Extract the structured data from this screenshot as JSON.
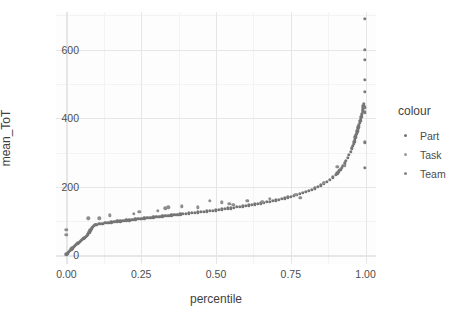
{
  "chart_data": {
    "type": "scatter",
    "title": "",
    "xlabel": "percentile",
    "ylabel": "mean_ToT",
    "xlim": [
      -0.035,
      1.035
    ],
    "ylim": [
      -25,
      710
    ],
    "xticks": [
      "0.00",
      "0.25",
      "0.50",
      "0.75",
      "1.00"
    ],
    "xtick_values": [
      0.0,
      0.25,
      0.5,
      0.75,
      1.0
    ],
    "yticks": [
      "0",
      "200",
      "400",
      "600"
    ],
    "ytick_values": [
      0,
      200,
      400,
      600
    ],
    "grid": "major and minor, light gray on white panel",
    "legend": {
      "title": "colour",
      "position": "right",
      "entries": [
        {
          "label": "Part",
          "color": "#757575"
        },
        {
          "label": "Task",
          "color": "#9a9a9a"
        },
        {
          "label": "Team",
          "color": "#848484"
        }
      ]
    },
    "series": [
      {
        "name": "Part",
        "color": "#757575",
        "comment": "dense monotone S-curve of per-participant mean ToT across percentiles",
        "points": [
          [
            0.0,
            3
          ],
          [
            0.004,
            6
          ],
          [
            0.008,
            10
          ],
          [
            0.012,
            14
          ],
          [
            0.016,
            18
          ],
          [
            0.02,
            21
          ],
          [
            0.024,
            25
          ],
          [
            0.028,
            28
          ],
          [
            0.032,
            31
          ],
          [
            0.036,
            34
          ],
          [
            0.04,
            37
          ],
          [
            0.044,
            40
          ],
          [
            0.048,
            43
          ],
          [
            0.052,
            46
          ],
          [
            0.056,
            49
          ],
          [
            0.06,
            52
          ],
          [
            0.064,
            55
          ],
          [
            0.068,
            58
          ],
          [
            0.072,
            62
          ],
          [
            0.076,
            67
          ],
          [
            0.08,
            73
          ],
          [
            0.084,
            79
          ],
          [
            0.088,
            84
          ],
          [
            0.092,
            87
          ],
          [
            0.096,
            89
          ],
          [
            0.1,
            90
          ],
          [
            0.11,
            92
          ],
          [
            0.12,
            93
          ],
          [
            0.13,
            95
          ],
          [
            0.14,
            96
          ],
          [
            0.15,
            97
          ],
          [
            0.16,
            98
          ],
          [
            0.17,
            99
          ],
          [
            0.18,
            100
          ],
          [
            0.19,
            101
          ],
          [
            0.2,
            102
          ],
          [
            0.21,
            103
          ],
          [
            0.22,
            104
          ],
          [
            0.23,
            105
          ],
          [
            0.24,
            106
          ],
          [
            0.25,
            107
          ],
          [
            0.26,
            108
          ],
          [
            0.27,
            109
          ],
          [
            0.28,
            110
          ],
          [
            0.29,
            111
          ],
          [
            0.3,
            112
          ],
          [
            0.31,
            113
          ],
          [
            0.32,
            114
          ],
          [
            0.33,
            115
          ],
          [
            0.34,
            116
          ],
          [
            0.35,
            117
          ],
          [
            0.36,
            118
          ],
          [
            0.37,
            119
          ],
          [
            0.38,
            120
          ],
          [
            0.39,
            121
          ],
          [
            0.4,
            122
          ],
          [
            0.41,
            123
          ],
          [
            0.42,
            124
          ],
          [
            0.43,
            125
          ],
          [
            0.44,
            126
          ],
          [
            0.45,
            127
          ],
          [
            0.46,
            128
          ],
          [
            0.47,
            129
          ],
          [
            0.48,
            130
          ],
          [
            0.49,
            131
          ],
          [
            0.5,
            132
          ],
          [
            0.51,
            133
          ],
          [
            0.52,
            134
          ],
          [
            0.53,
            136
          ],
          [
            0.54,
            137
          ],
          [
            0.55,
            138
          ],
          [
            0.56,
            139
          ],
          [
            0.57,
            141
          ],
          [
            0.58,
            142
          ],
          [
            0.59,
            143
          ],
          [
            0.6,
            145
          ],
          [
            0.61,
            146
          ],
          [
            0.62,
            148
          ],
          [
            0.63,
            149
          ],
          [
            0.64,
            151
          ],
          [
            0.65,
            152
          ],
          [
            0.66,
            154
          ],
          [
            0.67,
            156
          ],
          [
            0.68,
            157
          ],
          [
            0.69,
            159
          ],
          [
            0.7,
            161
          ],
          [
            0.71,
            163
          ],
          [
            0.72,
            165
          ],
          [
            0.73,
            167
          ],
          [
            0.74,
            169
          ],
          [
            0.75,
            171
          ],
          [
            0.76,
            174
          ],
          [
            0.77,
            176
          ],
          [
            0.78,
            179
          ],
          [
            0.79,
            182
          ],
          [
            0.8,
            185
          ],
          [
            0.81,
            188
          ],
          [
            0.82,
            192
          ],
          [
            0.83,
            196
          ],
          [
            0.84,
            200
          ],
          [
            0.85,
            205
          ],
          [
            0.86,
            210
          ],
          [
            0.87,
            215
          ],
          [
            0.88,
            221
          ],
          [
            0.89,
            228
          ],
          [
            0.9,
            236
          ],
          [
            0.905,
            240
          ],
          [
            0.91,
            245
          ],
          [
            0.915,
            250
          ],
          [
            0.92,
            256
          ],
          [
            0.925,
            262
          ],
          [
            0.93,
            269
          ],
          [
            0.935,
            276
          ],
          [
            0.94,
            284
          ],
          [
            0.945,
            293
          ],
          [
            0.95,
            303
          ],
          [
            0.955,
            313
          ],
          [
            0.958,
            320
          ],
          [
            0.96,
            326
          ],
          [
            0.962,
            332
          ],
          [
            0.964,
            338
          ],
          [
            0.966,
            344
          ],
          [
            0.968,
            350
          ],
          [
            0.97,
            356
          ],
          [
            0.972,
            362
          ],
          [
            0.974,
            368
          ],
          [
            0.976,
            374
          ],
          [
            0.978,
            380
          ],
          [
            0.98,
            386
          ],
          [
            0.982,
            392
          ],
          [
            0.984,
            398
          ],
          [
            0.986,
            405
          ],
          [
            0.988,
            412
          ],
          [
            0.99,
            420
          ],
          [
            0.991,
            425
          ],
          [
            0.992,
            430
          ],
          [
            0.993,
            436
          ],
          [
            0.994,
            442
          ]
        ]
      },
      {
        "name": "Task",
        "color": "#8e8e8e",
        "comment": "sparse points sitting above the main curve across the mid percentile range",
        "points": [
          [
            0.0,
            74
          ],
          [
            0.0,
            60
          ],
          [
            0.073,
            108
          ],
          [
            0.11,
            108
          ],
          [
            0.145,
            117
          ],
          [
            0.225,
            122
          ],
          [
            0.243,
            128
          ],
          [
            0.305,
            130
          ],
          [
            0.33,
            138
          ],
          [
            0.34,
            140
          ],
          [
            0.385,
            143
          ],
          [
            0.44,
            140
          ],
          [
            0.48,
            160
          ],
          [
            0.52,
            155
          ],
          [
            0.545,
            150
          ],
          [
            0.558,
            148
          ],
          [
            0.605,
            160
          ],
          [
            0.655,
            157
          ],
          [
            0.68,
            165
          ],
          [
            0.765,
            177
          ],
          [
            0.782,
            168
          ],
          [
            0.86,
            212
          ],
          [
            0.905,
            258
          ],
          [
            0.93,
            262
          ]
        ]
      },
      {
        "name": "Team",
        "color": "#7c7c7c",
        "comment": "vertical column of high outliers at the top percentile",
        "points": [
          [
            0.998,
            690
          ],
          [
            0.998,
            600
          ],
          [
            0.998,
            570
          ],
          [
            0.998,
            512
          ],
          [
            0.998,
            478
          ],
          [
            0.998,
            432
          ],
          [
            0.998,
            418
          ],
          [
            0.998,
            330
          ],
          [
            0.998,
            256
          ]
        ]
      }
    ]
  }
}
